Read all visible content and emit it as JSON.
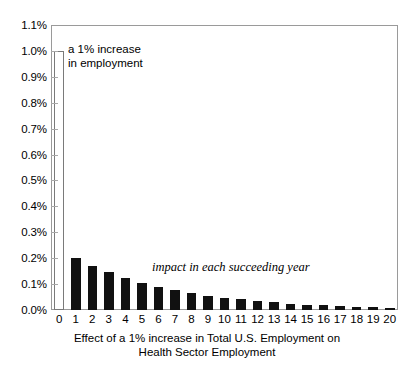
{
  "chart_data": {
    "type": "bar",
    "title": "",
    "subtitle": "",
    "xlabel_lines": [
      "Effect of a 1% increase in Total U.S. Employment on",
      "Health Sector Employment"
    ],
    "ylabel": "",
    "categories": [
      "0",
      "1",
      "2",
      "3",
      "4",
      "5",
      "6",
      "7",
      "8",
      "9",
      "10",
      "11",
      "12",
      "13",
      "14",
      "15",
      "16",
      "17",
      "18",
      "19",
      "20"
    ],
    "values": [
      1.0,
      0.2,
      0.17,
      0.146,
      0.124,
      0.106,
      0.09,
      0.077,
      0.065,
      0.056,
      0.048,
      0.041,
      0.035,
      0.03,
      0.025,
      0.021,
      0.018,
      0.015,
      0.013,
      0.011,
      0.009
    ],
    "value_unit": "%",
    "ylim": [
      0.0,
      1.1
    ],
    "ytick_values": [
      0.0,
      0.1,
      0.2,
      0.3,
      0.4,
      0.5,
      0.6,
      0.7,
      0.8,
      0.9,
      1.0,
      1.1
    ],
    "ytick_labels": [
      "0.0%",
      "0.1%",
      "0.2%",
      "0.3%",
      "0.4%",
      "0.5%",
      "0.6%",
      "0.7%",
      "0.8%",
      "0.9%",
      "1.0%",
      "1.1%"
    ],
    "grid": false,
    "legend": null,
    "bar_styles": [
      "hollow",
      "filled",
      "filled",
      "filled",
      "filled",
      "filled",
      "filled",
      "filled",
      "filled",
      "filled",
      "filled",
      "filled",
      "filled",
      "filled",
      "filled",
      "filled",
      "filled",
      "filled",
      "filled",
      "filled",
      "filled"
    ],
    "colors": {
      "bar_fill": "#111111",
      "bar_hollow_fill": "#ffffff",
      "bar_hollow_stroke": "#7a7a7a",
      "axis": "#9a9a9a",
      "text": "#000000",
      "background": "#ffffff"
    },
    "annotations": [
      {
        "id": "hollow-bar-note",
        "text": "a 1% increase\nin employment",
        "style": "regular",
        "target_category": "0"
      },
      {
        "id": "tail-note",
        "text": "impact in each succeeding year",
        "style": "italic-serif",
        "target_category": "7"
      }
    ]
  }
}
